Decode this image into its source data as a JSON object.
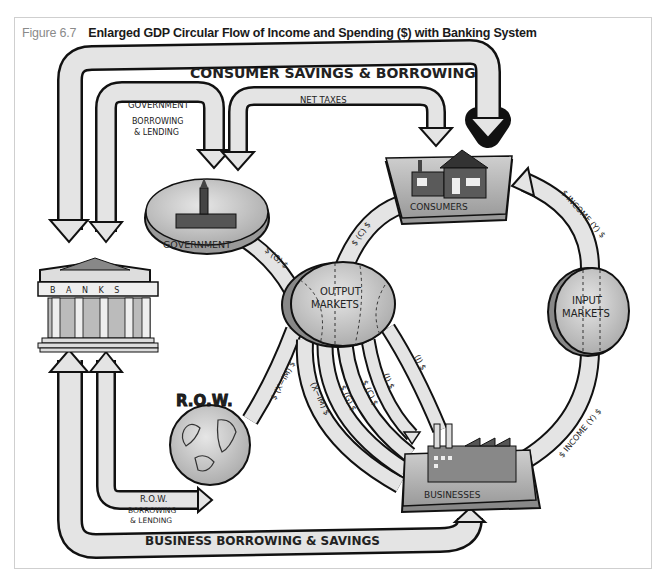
{
  "figure": {
    "number": "Figure 6.7",
    "title": "Enlarged GDP Circular Flow of Income and Spending ($) with Banking System"
  },
  "nodes": {
    "banks": "B A N K S",
    "government": "GOVERNMENT",
    "consumers": "CONSUMERS",
    "output_markets_line1": "OUTPUT",
    "output_markets_line2": "MARKETS",
    "input_markets_line1": "INPUT",
    "input_markets_line2": "MARKETS",
    "businesses": "BUSINESSES",
    "row": "R.O.W."
  },
  "flows": {
    "consumer_savings": "CONSUMER SAVINGS & BORROWING",
    "government_label": "GOVERNMENT",
    "government_borrowing_1": "BORROWING",
    "government_borrowing_2": "& LENDING",
    "net_taxes": "NET TAXES",
    "row_label": "R.O.W.",
    "row_borrowing_1": "BORROWING",
    "row_borrowing_2": "& LENDING",
    "business_borrowing": "BUSINESS BORROWING & SAVINGS",
    "income_top": "$ INCOME (Y) $",
    "income_bottom": "$ INCOME (Y) $",
    "gov_spending": "$ (G) $",
    "consumer_spending": "$ (C) $",
    "net_exports_row": "$ (X−IM) $",
    "spoke_x_im": "(X−IM) $",
    "spoke_g": "$ (G) $",
    "spoke_c": "$ (C) $",
    "spoke_i1": "(I) $",
    "spoke_i2": "(I) $"
  },
  "symbols": {
    "dollar": "$",
    "g": "G",
    "c": "C",
    "i": "I",
    "y": "Y"
  },
  "colors": {
    "arrow_fill": "#e4e4e4",
    "outline": "#111111",
    "node_fill": "#c8c8c8",
    "frame": "#cfcfcf",
    "caption_num": "#8a8a8a"
  }
}
